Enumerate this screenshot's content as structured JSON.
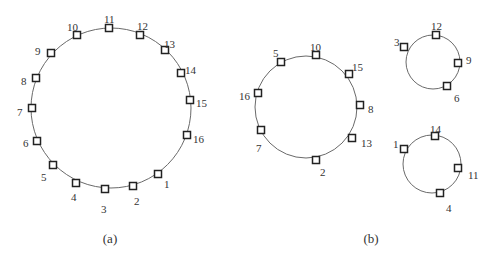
{
  "diagram": {
    "panels": [
      {
        "caption": "(a)",
        "caption_pos": [
          110,
          243
        ],
        "rings": [
          {
            "name": "ring-a",
            "center": [
              111,
              108
            ],
            "radius": 80,
            "nodes": [
              {
                "label": "11",
                "pos": [
                  109,
                  28
                ],
                "lpos": [
                  104,
                  19
                ]
              },
              {
                "label": "12",
                "pos": [
                  140,
                  35
                ],
                "lpos": [
                  137,
                  26
                ]
              },
              {
                "label": "13",
                "pos": [
                  165,
                  50
                ],
                "lpos": [
                  164,
                  44
                ]
              },
              {
                "label": "14",
                "pos": [
                  181,
                  73
                ],
                "lpos": [
                  185,
                  70
                ]
              },
              {
                "label": "15",
                "pos": [
                  190,
                  100
                ],
                "lpos": [
                  196,
                  103
                ]
              },
              {
                "label": "16",
                "pos": [
                  187,
                  135
                ],
                "lpos": [
                  193,
                  139
                ]
              },
              {
                "label": "1",
                "pos": [
                  158,
                  174
                ],
                "lpos": [
                  164,
                  184
                ]
              },
              {
                "label": "2",
                "pos": [
                  133,
                  186
                ],
                "lpos": [
                  134,
                  201
                ]
              },
              {
                "label": "3",
                "pos": [
                  105,
                  189
                ],
                "lpos": [
                  101,
                  209
                ]
              },
              {
                "label": "4",
                "pos": [
                  76,
                  183
                ],
                "lpos": [
                  71,
                  197
                ]
              },
              {
                "label": "5",
                "pos": [
                  53,
                  165
                ],
                "lpos": [
                  41,
                  177
                ]
              },
              {
                "label": "6",
                "pos": [
                  37,
                  141
                ],
                "lpos": [
                  23,
                  143
                ]
              },
              {
                "label": "7",
                "pos": [
                  32,
                  108
                ],
                "lpos": [
                  17,
                  112
                ]
              },
              {
                "label": "8",
                "pos": [
                  36,
                  78
                ],
                "lpos": [
                  21,
                  81
                ]
              },
              {
                "label": "9",
                "pos": [
                  51,
                  53
                ],
                "lpos": [
                  35,
                  51
                ]
              },
              {
                "label": "10",
                "pos": [
                  77,
                  35
                ],
                "lpos": [
                  67,
                  27
                ]
              }
            ]
          }
        ]
      },
      {
        "caption": "(b)",
        "caption_pos": [
          371,
          243
        ],
        "rings": [
          {
            "name": "ring-b1",
            "center": [
              306,
              107
            ],
            "radius": 51,
            "nodes": [
              {
                "label": "10",
                "pos": [
                  316,
                  55
                ],
                "lpos": [
                  310,
                  47
                ]
              },
              {
                "label": "15",
                "pos": [
                  349,
                  74
                ],
                "lpos": [
                  352,
                  67
                ]
              },
              {
                "label": "8",
                "pos": [
                  360,
                  105
                ],
                "lpos": [
                  368,
                  109
                ]
              },
              {
                "label": "13",
                "pos": [
                  352,
                  138
                ],
                "lpos": [
                  361,
                  143
                ]
              },
              {
                "label": "2",
                "pos": [
                  316,
                  160
                ],
                "lpos": [
                  320,
                  172
                ]
              },
              {
                "label": "7",
                "pos": [
                  261,
                  130
                ],
                "lpos": [
                  256,
                  148
                ]
              },
              {
                "label": "16",
                "pos": [
                  258,
                  93
                ],
                "lpos": [
                  239,
                  96
                ]
              },
              {
                "label": "5",
                "pos": [
                  281,
                  62
                ],
                "lpos": [
                  273,
                  53
                ]
              }
            ]
          },
          {
            "name": "ring-b2",
            "center": [
              433,
              62
            ],
            "radius": 27,
            "nodes": [
              {
                "label": "12",
                "pos": [
                  436,
                  35
                ],
                "lpos": [
                  431,
                  26
                ]
              },
              {
                "label": "9",
                "pos": [
                  458,
                  63
                ],
                "lpos": [
                  466,
                  60
                ]
              },
              {
                "label": "6",
                "pos": [
                  447,
                  86
                ],
                "lpos": [
                  454,
                  98
                ]
              },
              {
                "label": "3",
                "pos": [
                  404,
                  47
                ],
                "lpos": [
                  394,
                  42
                ]
              }
            ]
          },
          {
            "name": "ring-b3",
            "center": [
              432,
              164
            ],
            "radius": 29,
            "nodes": [
              {
                "label": "14",
                "pos": [
                  435,
                  136
                ],
                "lpos": [
                  430,
                  129
                ]
              },
              {
                "label": "11",
                "pos": [
                  458,
                  168
                ],
                "lpos": [
                  468,
                  175
                ]
              },
              {
                "label": "4",
                "pos": [
                  440,
                  193
                ],
                "lpos": [
                  446,
                  208
                ]
              },
              {
                "label": "1",
                "pos": [
                  404,
                  149
                ],
                "lpos": [
                  393,
                  144
                ]
              }
            ]
          }
        ]
      }
    ]
  }
}
